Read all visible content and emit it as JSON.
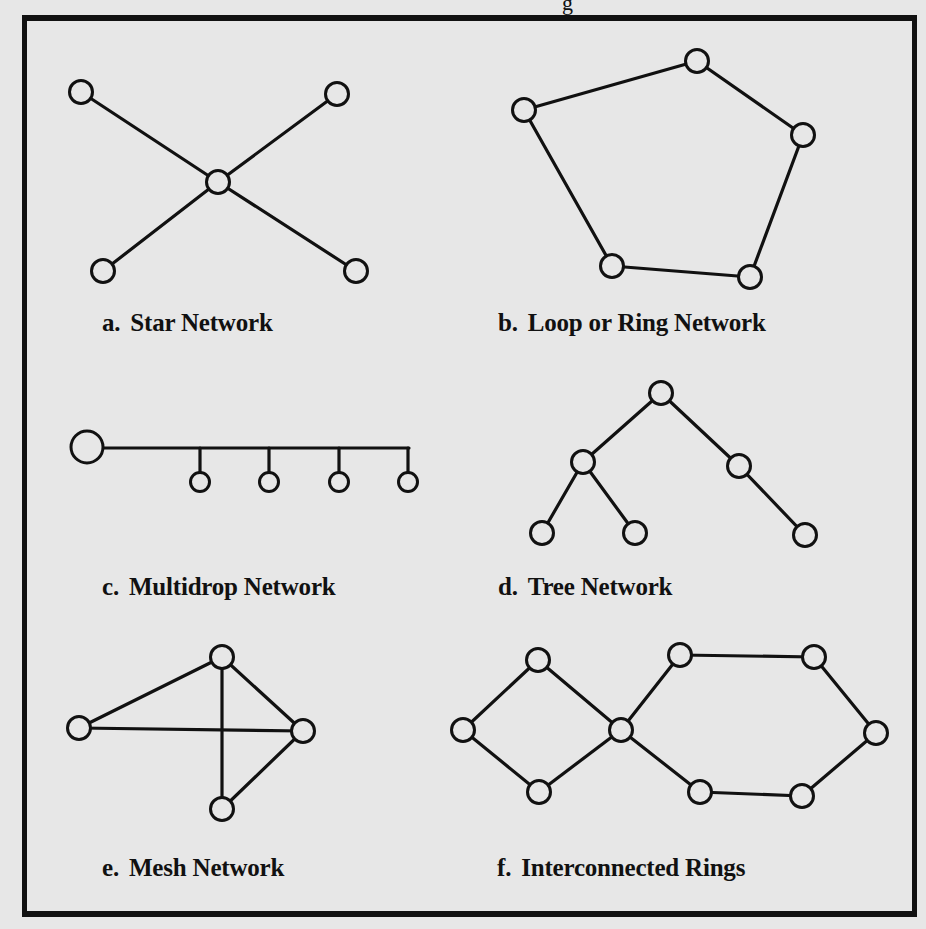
{
  "figure": {
    "title_fragment": "g",
    "panels": [
      {
        "id": "a",
        "letter": "a.",
        "title": "Star Network",
        "nodes": [
          [
            81,
            92
          ],
          [
            337,
            94
          ],
          [
            218,
            182
          ],
          [
            103,
            271
          ],
          [
            356,
            271
          ]
        ],
        "edges": [
          [
            0,
            2
          ],
          [
            1,
            2
          ],
          [
            2,
            3
          ],
          [
            2,
            4
          ]
        ]
      },
      {
        "id": "b",
        "letter": "b.",
        "title": "Loop or Ring Network",
        "nodes": [
          [
            697,
            61
          ],
          [
            803,
            135
          ],
          [
            750,
            277
          ],
          [
            612,
            266
          ],
          [
            524,
            110
          ]
        ],
        "edges": [
          [
            0,
            1
          ],
          [
            1,
            2
          ],
          [
            2,
            3
          ],
          [
            3,
            4
          ],
          [
            4,
            0
          ]
        ]
      },
      {
        "id": "c",
        "letter": "c.",
        "title": "Multidrop Network",
        "nodes": [
          [
            87,
            447
          ],
          [
            200,
            482
          ],
          [
            269,
            482
          ],
          [
            339,
            482
          ],
          [
            408,
            482
          ]
        ],
        "edges": []
      },
      {
        "id": "d",
        "letter": "d.",
        "title": "Tree Network",
        "nodes": [
          [
            661,
            393
          ],
          [
            583,
            462
          ],
          [
            739,
            466
          ],
          [
            542,
            533
          ],
          [
            635,
            533
          ],
          [
            805,
            535
          ]
        ],
        "edges": [
          [
            0,
            1
          ],
          [
            0,
            2
          ],
          [
            1,
            3
          ],
          [
            1,
            4
          ],
          [
            2,
            5
          ]
        ]
      },
      {
        "id": "e",
        "letter": "e.",
        "title": "Mesh Network",
        "nodes": [
          [
            222,
            657
          ],
          [
            79,
            728
          ],
          [
            303,
            731
          ],
          [
            222,
            809
          ]
        ],
        "edges": [
          [
            0,
            1
          ],
          [
            0,
            2
          ],
          [
            0,
            3
          ],
          [
            1,
            2
          ],
          [
            2,
            3
          ]
        ]
      },
      {
        "id": "f",
        "letter": "f.",
        "title": "Interconnected Rings",
        "nodes": [
          [
            538,
            660
          ],
          [
            463,
            730
          ],
          [
            539,
            792
          ],
          [
            621,
            730
          ],
          [
            680,
            655
          ],
          [
            814,
            657
          ],
          [
            876,
            733
          ],
          [
            802,
            796
          ],
          [
            700,
            792
          ]
        ],
        "edges": [
          [
            0,
            1
          ],
          [
            1,
            2
          ],
          [
            2,
            3
          ],
          [
            3,
            0
          ],
          [
            3,
            4
          ],
          [
            4,
            5
          ],
          [
            5,
            6
          ],
          [
            6,
            7
          ],
          [
            7,
            8
          ],
          [
            8,
            3
          ]
        ]
      }
    ]
  }
}
